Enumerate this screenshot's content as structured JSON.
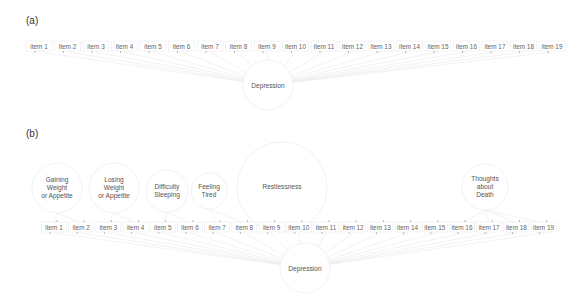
{
  "panels": [
    {
      "label": "(a)",
      "items": [
        "item 1",
        "item 2",
        "item 3",
        "item 4",
        "item 5",
        "item 6",
        "item 7",
        "item 8",
        "item 9",
        "item 10",
        "item 11",
        "item 12",
        "item 13",
        "item 14",
        "item 15",
        "item 16",
        "item 17",
        "item 18",
        "item 19"
      ],
      "latent": "Depression"
    },
    {
      "label": "(b)",
      "items": [
        "item 1",
        "item 2",
        "item 3",
        "item 4",
        "item 5",
        "item 6",
        "item 7",
        "item 8",
        "item 9",
        "item 10",
        "item 11",
        "item 12",
        "item 13",
        "item 14",
        "item 15",
        "item 16",
        "item 17",
        "item 18",
        "item 19"
      ],
      "latent": "Depression",
      "specific_factors": [
        {
          "lines": [
            "Gaining",
            "Weight",
            "or Appetite"
          ],
          "items": [
            1,
            2
          ]
        },
        {
          "lines": [
            "Losing",
            "Weight",
            "or Appetite"
          ],
          "items": [
            3,
            4
          ]
        },
        {
          "lines": [
            "Difficulty",
            "Sleeping"
          ],
          "items": [
            5,
            6
          ]
        },
        {
          "lines": [
            "Feeling",
            "Tired"
          ],
          "items": [
            7,
            8
          ]
        },
        {
          "lines": [
            "Restlessness"
          ],
          "items": [
            9,
            10
          ]
        },
        {
          "lines": [
            "Thoughts",
            "about",
            "Death"
          ],
          "items": [
            16,
            17,
            18,
            19
          ]
        }
      ]
    }
  ],
  "colors": {
    "edge": "#e4e4e4",
    "circle_stroke": "#eeeeee",
    "text": "#666666"
  }
}
